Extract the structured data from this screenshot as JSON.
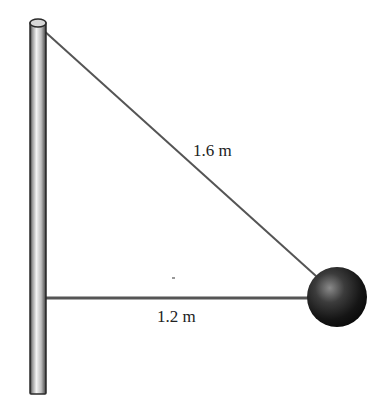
{
  "diagram": {
    "type": "physics-free-body-setup",
    "elements": {
      "pole": {
        "description": "vertical pole"
      },
      "diagonal_string": {
        "length_label": "1.6 m"
      },
      "horizontal_string": {
        "length_label": "1.2 m"
      },
      "ball": {
        "description": "dark sphere attached to both strings"
      }
    },
    "colors": {
      "line": "#555555",
      "pole_edge": "#333333",
      "ball_dark": "#111111",
      "ball_highlight": "#8a8a8a"
    }
  }
}
